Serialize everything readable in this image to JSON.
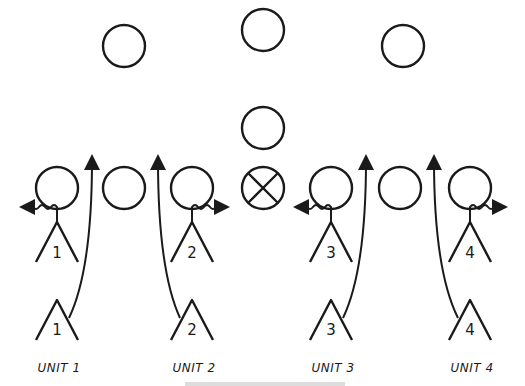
{
  "diagram": {
    "ink_color": "#1a1a1a",
    "background": "#ffffff",
    "defense": {
      "deep_circles": [
        {
          "x": 124,
          "y": 46
        },
        {
          "x": 263,
          "y": 30
        },
        {
          "x": 403,
          "y": 46
        }
      ],
      "middle_circle": {
        "x": 263,
        "y": 128
      },
      "line_circles": [
        {
          "x": 57,
          "y": 188
        },
        {
          "x": 124,
          "y": 188
        },
        {
          "x": 192,
          "y": 188
        },
        {
          "x": 331,
          "y": 188
        },
        {
          "x": 400,
          "y": 188
        },
        {
          "x": 470,
          "y": 188
        }
      ],
      "center_marker": {
        "x": 263,
        "y": 188,
        "symbol": "circle-x"
      }
    },
    "units": [
      {
        "label": "UNIT 1",
        "number": "1",
        "x": 57,
        "wiggle": "left",
        "route_to_x": 92
      },
      {
        "label": "UNIT 2",
        "number": "2",
        "x": 192,
        "wiggle": "right",
        "route_to_x": 158
      },
      {
        "label": "UNIT 3",
        "number": "3",
        "x": 331,
        "wiggle": "left",
        "route_to_x": 366
      },
      {
        "label": "UNIT 4",
        "number": "4",
        "x": 470,
        "wiggle": "right",
        "route_to_x": 434
      }
    ]
  }
}
